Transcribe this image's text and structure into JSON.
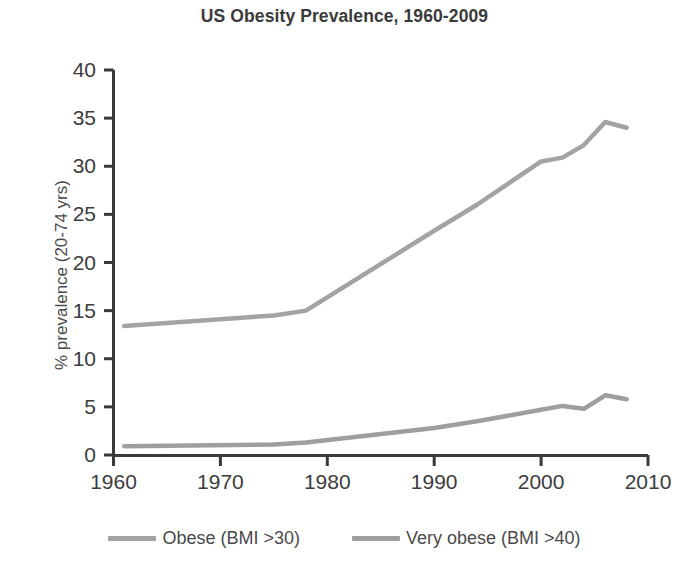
{
  "chart_data": {
    "type": "line",
    "title": "US Obesity Prevalence, 1960-2009",
    "xlabel": "",
    "ylabel": "% prevalence (20-74 yrs)",
    "xlim": [
      1960,
      2010
    ],
    "ylim": [
      0,
      40
    ],
    "xticks": [
      "1960",
      "1970",
      "1980",
      "1990",
      "2000",
      "2010"
    ],
    "xtick_values": [
      1960,
      1970,
      1980,
      1990,
      2000,
      2010
    ],
    "yticks": [
      "0",
      "5",
      "10",
      "15",
      "20",
      "25",
      "30",
      "35",
      "40"
    ],
    "ytick_values": [
      0,
      5,
      10,
      15,
      20,
      25,
      30,
      35,
      40
    ],
    "grid": false,
    "legend_position": "bottom",
    "series": [
      {
        "name": "Obese (BMI >30)",
        "color": "#a3a3a3",
        "x": [
          1961,
          1975,
          1978,
          1990,
          1994,
          2000,
          2002,
          2004,
          2006,
          2008
        ],
        "values": [
          13.4,
          14.5,
          15.0,
          23.3,
          26.0,
          30.5,
          30.9,
          32.2,
          34.6,
          34.0
        ]
      },
      {
        "name": "Very obese (BMI >40)",
        "color": "#9e9e9e",
        "x": [
          1961,
          1975,
          1978,
          1990,
          1994,
          2000,
          2002,
          2004,
          2006,
          2008
        ],
        "values": [
          0.9,
          1.1,
          1.3,
          2.8,
          3.5,
          4.7,
          5.1,
          4.8,
          6.2,
          5.8
        ]
      }
    ]
  },
  "axes": {
    "axis_color": "#3a3a3a",
    "line_color_obese": "#a3a3a3",
    "line_color_very_obese": "#9e9e9e"
  },
  "legend": {
    "entries": [
      {
        "label": "Obese (BMI >30)",
        "color": "#a3a3a3"
      },
      {
        "label": "Very obese (BMI >40)",
        "color": "#9e9e9e"
      }
    ]
  }
}
